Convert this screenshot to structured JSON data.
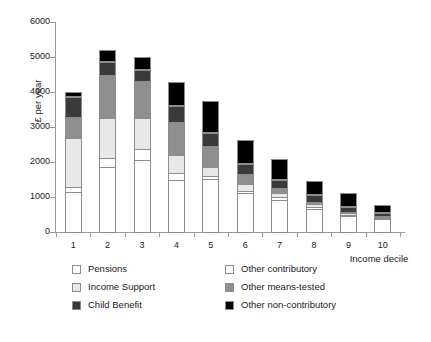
{
  "chart_data": {
    "type": "bar",
    "stacked": true,
    "title": "",
    "xlabel": "Income decile",
    "ylabel": "£ per year",
    "categories": [
      "1",
      "2",
      "3",
      "4",
      "5",
      "6",
      "7",
      "8",
      "9",
      "10"
    ],
    "ylim": [
      0,
      6000
    ],
    "yticks": [
      0,
      1000,
      2000,
      3000,
      4000,
      5000,
      6000
    ],
    "grid": false,
    "legend_position": "below-axis",
    "series": [
      {
        "name": "Pensions",
        "color": "#ffffff",
        "values": [
          1180,
          1880,
          2100,
          1520,
          1530,
          1130,
          950,
          690,
          490,
          400
        ]
      },
      {
        "name": "Other contributory",
        "color": "#ffffff",
        "values": [
          170,
          300,
          320,
          220,
          140,
          100,
          110,
          90,
          60,
          50
        ]
      },
      {
        "name": "Income Support",
        "color": "#e8e8e8",
        "values": [
          1410,
          1170,
          920,
          560,
          270,
          220,
          140,
          110,
          80,
          60
        ]
      },
      {
        "name": "Other means-tested",
        "color": "#8f8f8f",
        "values": [
          650,
          1250,
          1090,
          950,
          630,
          330,
          180,
          90,
          50,
          40
        ]
      },
      {
        "name": "Child Benefit",
        "color": "#3a3a3a",
        "values": [
          580,
          400,
          350,
          480,
          410,
          310,
          260,
          210,
          180,
          120
        ]
      },
      {
        "name": "Other non-contributory",
        "color": "#000000",
        "values": [
          160,
          350,
          350,
          700,
          910,
          690,
          580,
          400,
          380,
          210
        ]
      }
    ],
    "totals": [
      4150,
      5350,
      5130,
      4430,
      3890,
      2780,
      2220,
      1590,
      1240,
      880
    ]
  },
  "legend": {
    "entries": [
      {
        "label": "Pensions",
        "color": "#ffffff"
      },
      {
        "label": "Other contributory",
        "color": "#ffffff"
      },
      {
        "label": "Income Support",
        "color": "#e8e8e8"
      },
      {
        "label": "Other means-tested",
        "color": "#8f8f8f"
      },
      {
        "label": "Child Benefit",
        "color": "#3a3a3a"
      },
      {
        "label": "Other non-contributory",
        "color": "#000000"
      }
    ]
  },
  "colors": {
    "axis": "#9a9a9a",
    "segment_border": "#8c8c8c",
    "text": "#1a1a1a",
    "background": "#ffffff"
  }
}
